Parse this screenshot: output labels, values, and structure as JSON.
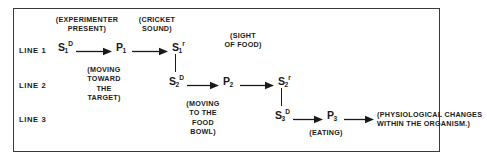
{
  "figure": {
    "frame_color": "#3a3a3a",
    "ink_color": "#1a1a1a",
    "background": "#ffffff",
    "line_labels": [
      {
        "id": "line-1",
        "text": "LINE 1"
      },
      {
        "id": "line-2",
        "text": "LINE 2"
      },
      {
        "id": "line-3",
        "text": "LINE 3"
      }
    ],
    "terms": {
      "s1d": {
        "base": "S",
        "sub": "1",
        "sup": "D"
      },
      "p1": {
        "base": "P",
        "sub": "1",
        "sup": ""
      },
      "s1r": {
        "base": "S",
        "sub": "1",
        "sup": "r"
      },
      "s2d": {
        "base": "S",
        "sub": "2",
        "sup": "D"
      },
      "p2": {
        "base": "P",
        "sub": "2",
        "sup": ""
      },
      "s2r": {
        "base": "S",
        "sub": "2",
        "sup": "r"
      },
      "s3d": {
        "base": "S",
        "sub": "3",
        "sup": "D"
      },
      "p3": {
        "base": "P",
        "sub": "3",
        "sup": ""
      }
    },
    "annotations": {
      "experimenter_present": "(EXPERIMENTER\nPRESENT)",
      "cricket_sound": "(CRICKET\nSOUND)",
      "sight_of_food": "(SIGHT\nOF FOOD)",
      "moving_toward_target": "(MOVING\nTOWARD\nTHE\nTARGET)",
      "moving_to_food_bowl": "(MOVING\nTO THE\nFOOD\nBOWL)",
      "eating": "(EATING)",
      "physiological_changes": "(PHYSIOLOGICAL CHANGES\nWITHIN THE ORGANISM.)"
    }
  }
}
